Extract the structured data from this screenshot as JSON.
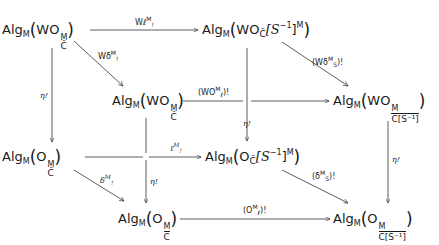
{
  "diagram": {
    "type": "commutative-cube",
    "nodes": {
      "A": {
        "prefix": "Alg",
        "sub": "M",
        "core": "WO",
        "sup": "M",
        "low": "C̃",
        "tail": ""
      },
      "B": {
        "prefix": "Alg",
        "sub": "M",
        "core": "WO",
        "low": "C̃",
        "bracket": "[S",
        "exp": "−1",
        "close": "]",
        "sup": "M"
      },
      "C": {
        "prefix": "Alg",
        "sub": "M",
        "core": "WO",
        "sup": "M",
        "low": "C̃"
      },
      "D": {
        "prefix": "Alg",
        "sub": "M",
        "core": "WO",
        "sup": "M",
        "low": "C[S⁻¹]"
      },
      "E": {
        "prefix": "Alg",
        "sub": "M",
        "core": "O",
        "sup": "M",
        "low": "C̃"
      },
      "F": {
        "prefix": "Alg",
        "sub": "M",
        "core": "O",
        "low": "C̃",
        "bracket": "[S",
        "exp": "−1",
        "close": "]",
        "sup": "M"
      },
      "G": {
        "prefix": "Alg",
        "sub": "M",
        "core": "O",
        "sup": "M",
        "low": "C"
      },
      "H": {
        "prefix": "Alg",
        "sub": "M",
        "core": "O",
        "sup": "M",
        "low": "C[S⁻¹]"
      }
    },
    "edges": {
      "A_B": {
        "main": "Wℓ",
        "sup": "M",
        "sub": "!"
      },
      "A_C": {
        "main": "Wδ",
        "sup": "M",
        "sub": "!"
      },
      "C_D": {
        "main": "(WO",
        "sup": "M",
        "sub": "ℓ",
        "tail": ")!"
      },
      "B_D": {
        "main": "(Wδ",
        "sup": "M",
        "sub": "S",
        "tail": ")!"
      },
      "A_E": {
        "main": "η!"
      },
      "B_F": {
        "main": "η!"
      },
      "C_G": {
        "main": "η!"
      },
      "D_H": {
        "main": "η!"
      },
      "E_F": {
        "main": "ℓ",
        "sup": "M",
        "sub": "!"
      },
      "E_G": {
        "main": "δ",
        "sup": "M",
        "sub": "!"
      },
      "F_H": {
        "main": "(δ",
        "sup": "M",
        "sub": "S",
        "tail": ")!"
      },
      "G_H": {
        "main": "(O",
        "sup": "M",
        "sub": "ℓ",
        "tail": ")!"
      }
    }
  }
}
